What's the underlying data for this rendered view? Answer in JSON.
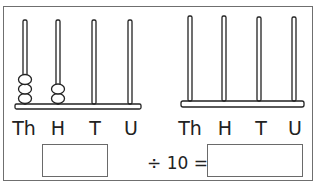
{
  "abaci": [
    {
      "name": "left-abacus",
      "columns": [
        {
          "label": "Th",
          "beads": 3
        },
        {
          "label": "H",
          "beads": 2
        },
        {
          "label": "T",
          "beads": 0
        },
        {
          "label": "U",
          "beads": 0
        }
      ]
    },
    {
      "name": "right-abacus",
      "columns": [
        {
          "label": "Th",
          "beads": 0
        },
        {
          "label": "H",
          "beads": 0
        },
        {
          "label": "T",
          "beads": 0
        },
        {
          "label": "U",
          "beads": 0
        }
      ]
    }
  ],
  "equation": {
    "input_box": "",
    "operator_text": "÷ 10 =",
    "answer_box": ""
  }
}
